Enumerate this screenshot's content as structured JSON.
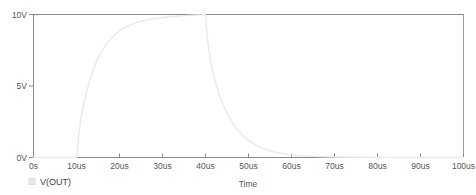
{
  "chart_data": {
    "type": "line",
    "title": "",
    "xlabel": "Time",
    "ylabel": "",
    "grid": false,
    "legend_position": "bottom-left",
    "xlim": [
      0,
      100
    ],
    "ylim": [
      0,
      10
    ],
    "x_unit": "us",
    "y_unit": "V",
    "x_ticks": [
      0,
      10,
      20,
      30,
      40,
      50,
      60,
      70,
      80,
      90,
      100
    ],
    "x_tick_labels": [
      "0s",
      "10us",
      "20us",
      "30us",
      "40us",
      "50us",
      "60us",
      "70us",
      "80us",
      "90us",
      "100us"
    ],
    "y_ticks": [
      0,
      5,
      10
    ],
    "y_tick_labels": [
      "0V",
      "5V",
      "10V"
    ],
    "series": [
      {
        "name": "V(OUT)",
        "color": "#e9e9e9",
        "x": [
          0,
          2,
          4,
          6,
          8,
          10,
          10.5,
          11,
          12,
          13,
          14,
          15,
          16,
          17,
          18,
          19,
          20,
          21,
          22,
          23,
          24,
          25,
          26,
          27,
          28,
          29,
          30,
          31,
          32,
          33,
          34,
          35,
          36,
          37,
          38,
          39,
          40,
          40.5,
          41,
          42,
          43,
          44,
          45,
          46,
          47,
          48,
          49,
          50,
          51,
          52,
          53,
          54,
          55,
          56,
          57,
          58,
          59,
          60,
          62,
          65,
          70,
          75,
          80,
          85,
          90,
          95,
          100
        ],
        "y": [
          0,
          0,
          0,
          0,
          0,
          0,
          1.55,
          2.7,
          4.2,
          5.35,
          6.25,
          6.95,
          7.5,
          7.95,
          8.3,
          8.6,
          8.85,
          9.05,
          9.2,
          9.33,
          9.43,
          9.52,
          9.6,
          9.66,
          9.72,
          9.76,
          9.8,
          9.83,
          9.86,
          9.88,
          9.9,
          9.92,
          9.94,
          9.95,
          9.96,
          9.97,
          10.0,
          8.2,
          7.0,
          5.6,
          4.55,
          3.75,
          3.1,
          2.55,
          2.1,
          1.75,
          1.45,
          1.2,
          1.0,
          0.83,
          0.69,
          0.57,
          0.47,
          0.39,
          0.33,
          0.27,
          0.22,
          0.18,
          0.13,
          0.08,
          0.04,
          0.02,
          0.01,
          0.0,
          0.0,
          0.0,
          0.0
        ]
      }
    ]
  },
  "legend": {
    "entries": [
      {
        "label": "V(OUT)",
        "marker_color": "#e9e9e9"
      }
    ]
  },
  "axes": {
    "x_title": "Time"
  },
  "colors": {
    "background": "#ffffff",
    "axis": "#8a8a8a",
    "frame": "#9a9a9a",
    "tick_text": "#555555",
    "trace": "#e9e9e9"
  }
}
